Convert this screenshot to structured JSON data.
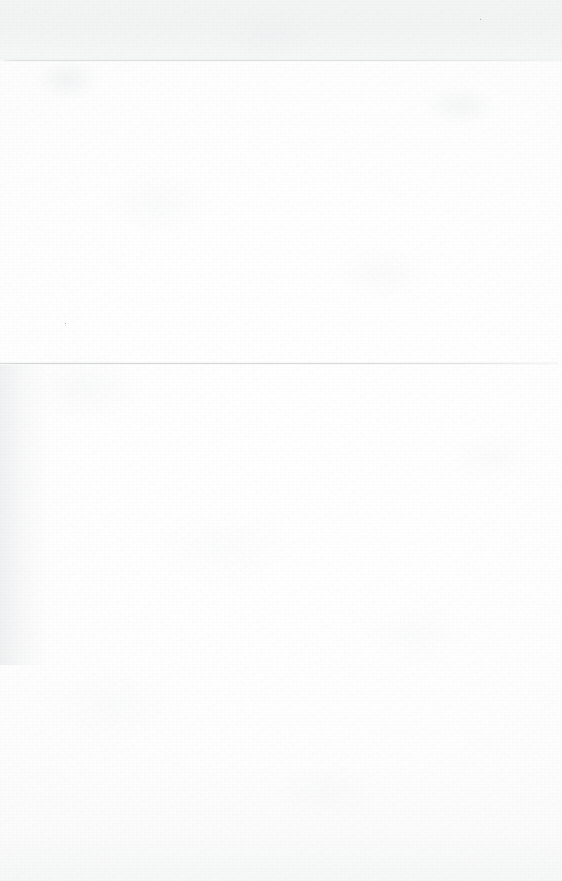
{
  "page": {
    "kind": "scanned-blank-page",
    "width": 562,
    "height": 881,
    "background_color": "#fefefe",
    "text_content": "",
    "notes_text": ""
  },
  "surface": {
    "paper_color": "#fefefe",
    "paper_edge_color": "#f7f8f8",
    "header_band_color": "#f2f3f3",
    "left_edge_wash_color": "#e4e6e7",
    "bottom_wash_color": "#f5f6f6",
    "grain_color": "#96989b"
  },
  "rules": [
    {
      "id": "rule-top",
      "y": 60,
      "x_start": 4,
      "x_end": 562,
      "thickness": 1,
      "color": "#dbdde0",
      "fade_edge": "right"
    },
    {
      "id": "rule-bottom",
      "y": 363,
      "x_start": 0,
      "x_end": 558,
      "thickness": 1,
      "color": "#d2d4d7",
      "fade_edge": "right"
    }
  ],
  "specks": [
    {
      "id": "speck-upper-right",
      "x": 480,
      "y": 19,
      "color": "#a8aaad"
    },
    {
      "id": "speck-mid-left",
      "x": 65,
      "y": 323,
      "color": "#a8aaad"
    }
  ]
}
